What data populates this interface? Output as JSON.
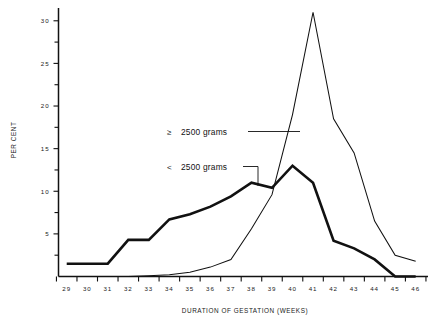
{
  "chart_data": {
    "type": "line",
    "title": "",
    "xlabel": "DURATION OF GESTATION (WEEKS)",
    "ylabel": "PER CENT",
    "x": [
      29,
      30,
      31,
      32,
      33,
      34,
      35,
      36,
      37,
      38,
      39,
      40,
      41,
      42,
      43,
      44,
      45,
      46
    ],
    "xlim": [
      28.6,
      46.6
    ],
    "ylim": [
      0,
      31.5
    ],
    "xticks": [
      "29",
      "30",
      "31",
      "32",
      "33",
      "34",
      "35",
      "36",
      "37",
      "38",
      "39",
      "40",
      "41",
      "42",
      "43",
      "44",
      "45",
      "46"
    ],
    "yticks": [
      "5",
      "10",
      "15",
      "20",
      "25",
      "30"
    ],
    "ytick_values": [
      5,
      10,
      15,
      20,
      25,
      30
    ],
    "yminor_values": [
      2.5,
      7.5,
      12.5,
      17.5,
      22.5,
      27.5
    ],
    "grid": false,
    "legend_position": "inside-left-of-peak",
    "series": [
      {
        "name": "≥  2500 grams",
        "style": "thin",
        "values": [
          0,
          0,
          0,
          0,
          0.1,
          0.2,
          0.5,
          1.1,
          2.0,
          5.6,
          9.6,
          19.0,
          31.0,
          18.5,
          14.5,
          6.5,
          2.5,
          1.8
        ]
      },
      {
        "name": "<  2500 grams",
        "style": "thick",
        "values": [
          1.5,
          1.5,
          1.5,
          4.3,
          4.3,
          6.7,
          7.3,
          8.2,
          9.4,
          11.0,
          10.4,
          13.0,
          11.0,
          4.2,
          3.3,
          2.0,
          0.0,
          0.0
        ]
      }
    ]
  },
  "axes": {
    "y_title": "PER CENT",
    "x_title": "DURATION OF GESTATION (WEEKS)"
  },
  "legend": {
    "high": {
      "symbol": "≥",
      "label": "2500 grams"
    },
    "low": {
      "symbol": "<",
      "label": "2500 grams"
    }
  }
}
